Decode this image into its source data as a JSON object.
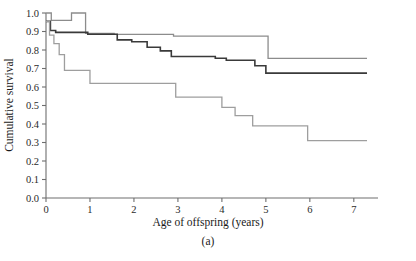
{
  "chart_data": {
    "type": "line",
    "title": "",
    "panel_label": "(a)",
    "xlabel": "Age of offspring (years)",
    "ylabel": "Cumulative survival",
    "xlim": [
      0,
      7.55
    ],
    "ylim": [
      0,
      1.0
    ],
    "grid": false,
    "legend_position": "none",
    "xticks": [
      0,
      1,
      2,
      3,
      4,
      5,
      6,
      7
    ],
    "xtick_labels": [
      "0",
      "1",
      "2",
      "3",
      "4",
      "5",
      "6",
      "7"
    ],
    "yticks": [
      0.0,
      0.1,
      0.2,
      0.3,
      0.4,
      0.5,
      0.6,
      0.7,
      0.8,
      0.9,
      1.0
    ],
    "ytick_labels": [
      "0.0",
      "0.1",
      "0.2",
      "0.3",
      "0.4",
      "0.5",
      "0.6",
      "0.7",
      "0.8",
      "0.9",
      "1.0"
    ],
    "series": [
      {
        "name": "upper-curve",
        "style": "step",
        "color": "#8c8c8c",
        "stroke_width": 1.3,
        "x": [
          0.0,
          0.12,
          0.12,
          0.58,
          0.58,
          0.9,
          0.9,
          1.55,
          1.55,
          2.9,
          2.9,
          5.05,
          5.05,
          7.3
        ],
        "y": [
          1.0,
          1.0,
          0.96,
          0.96,
          1.0,
          1.0,
          0.89,
          0.89,
          0.885,
          0.885,
          0.875,
          0.875,
          0.755,
          0.755
        ]
      },
      {
        "name": "middle-curve",
        "style": "step",
        "color": "#3a3a3a",
        "stroke_width": 1.6,
        "x": [
          0.0,
          0.1,
          0.1,
          0.22,
          0.22,
          0.95,
          0.95,
          1.62,
          1.62,
          1.95,
          1.95,
          2.3,
          2.3,
          2.6,
          2.6,
          2.85,
          2.85,
          3.85,
          3.85,
          4.1,
          4.1,
          4.75,
          4.75,
          5.0,
          5.0,
          7.3
        ],
        "y": [
          0.955,
          0.955,
          0.905,
          0.905,
          0.895,
          0.895,
          0.885,
          0.885,
          0.855,
          0.855,
          0.845,
          0.845,
          0.815,
          0.815,
          0.795,
          0.795,
          0.765,
          0.765,
          0.755,
          0.755,
          0.745,
          0.745,
          0.715,
          0.715,
          0.675,
          0.675
        ]
      },
      {
        "name": "lower-curve",
        "style": "step",
        "color": "#9e9e9e",
        "stroke_width": 1.3,
        "x": [
          0.0,
          0.08,
          0.08,
          0.18,
          0.18,
          0.3,
          0.3,
          0.42,
          0.42,
          1.0,
          1.0,
          2.95,
          2.95,
          4.0,
          4.0,
          4.3,
          4.3,
          4.7,
          4.7,
          5.95,
          5.95,
          7.3
        ],
        "y": [
          0.955,
          0.955,
          0.88,
          0.88,
          0.835,
          0.835,
          0.775,
          0.775,
          0.69,
          0.69,
          0.62,
          0.62,
          0.545,
          0.545,
          0.49,
          0.49,
          0.445,
          0.445,
          0.39,
          0.39,
          0.31,
          0.31
        ]
      }
    ]
  },
  "axes": {
    "x_title": "Age of offspring (years)",
    "y_title": "Cumulative survival"
  },
  "caption": {
    "panel": "(a)"
  },
  "colors": {
    "upper": "#8c8c8c",
    "middle": "#3a3a3a",
    "lower": "#9e9e9e",
    "axis": "#6e6e6e",
    "text": "#1a1a1a",
    "background": "#ffffff"
  }
}
